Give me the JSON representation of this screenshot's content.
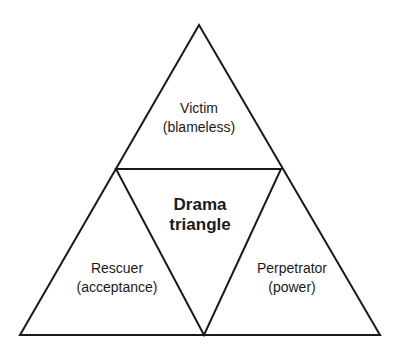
{
  "diagram": {
    "title": "Drama triangle",
    "center": {
      "line1": "Drama",
      "line2": "triangle"
    },
    "roles": [
      {
        "name": "Victim",
        "descriptor": "(blameless)",
        "position": "top"
      },
      {
        "name": "Rescuer",
        "descriptor": "(acceptance)",
        "position": "bottom-left"
      },
      {
        "name": "Perpetrator",
        "descriptor": "(power)",
        "position": "bottom-right"
      }
    ],
    "colors": {
      "stroke": "#1a1a1a",
      "background": "#ffffff",
      "text": "#1a1a1a"
    }
  }
}
